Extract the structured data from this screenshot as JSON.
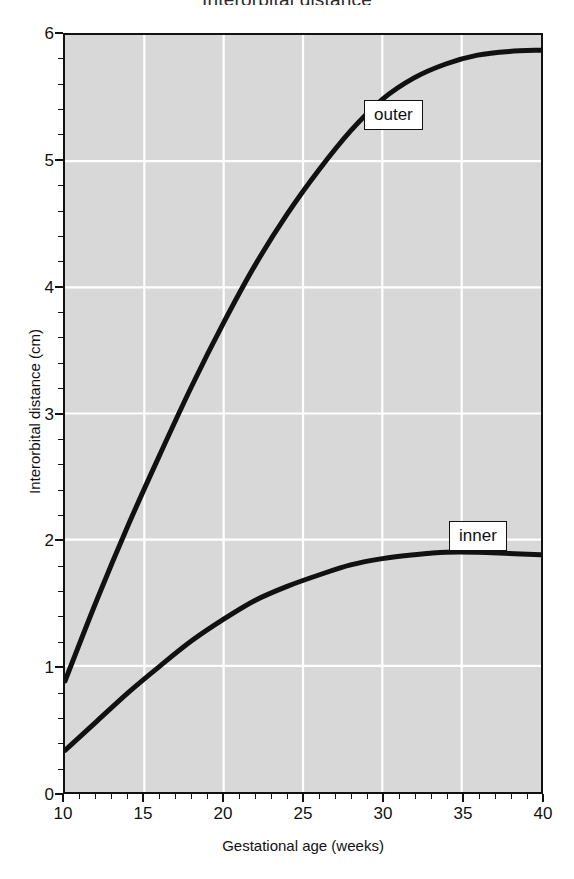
{
  "chart_data": {
    "type": "line",
    "title": "Interorbital distance",
    "xlabel": "Gestational age (weeks)",
    "ylabel": "Interorbital distance (cm)",
    "xlim": [
      10,
      40
    ],
    "ylim": [
      0,
      6
    ],
    "grid": true,
    "grid_color": "#ffffff",
    "plot_background": "#d8d8d8",
    "line_color": "#111111",
    "legend_position": "inline-callout-boxes",
    "x_ticks": [
      10,
      15,
      20,
      25,
      30,
      35,
      40
    ],
    "x_tick_labels": [
      "10",
      "15",
      "20",
      "25",
      "30",
      "35",
      "40"
    ],
    "x_minor_tick_step": 1,
    "y_ticks": [
      0,
      1,
      2,
      3,
      4,
      5,
      6
    ],
    "y_tick_labels": [
      "0",
      "1",
      "2",
      "3",
      "4",
      "5",
      "6"
    ],
    "y_minor_tick_step": 0.2,
    "x": [
      10,
      12,
      14,
      16,
      18,
      20,
      22,
      24,
      26,
      28,
      30,
      32,
      34,
      36,
      38,
      40
    ],
    "series": [
      {
        "name": "outer",
        "label": "outer",
        "values": [
          0.88,
          1.52,
          2.12,
          2.68,
          3.22,
          3.72,
          4.18,
          4.58,
          4.93,
          5.24,
          5.49,
          5.66,
          5.77,
          5.84,
          5.87,
          5.88
        ]
      },
      {
        "name": "inner",
        "label": "inner",
        "values": [
          0.33,
          0.56,
          0.79,
          1.0,
          1.2,
          1.37,
          1.52,
          1.63,
          1.72,
          1.8,
          1.85,
          1.88,
          1.9,
          1.9,
          1.89,
          1.88
        ]
      }
    ],
    "annotations": [
      {
        "text": "outer",
        "x": 29.7,
        "y": 5.38,
        "boxed": true
      },
      {
        "text": "inner",
        "x": 34.9,
        "y": 2.05,
        "boxed": true
      }
    ]
  },
  "axes": {
    "y_title": "Interorbital distance (cm)",
    "x_title": "Gestational age (weeks)",
    "y_labels": [
      "6",
      "5",
      "4",
      "3",
      "2",
      "1",
      "0"
    ],
    "x_labels": [
      "10",
      "15",
      "20",
      "25",
      "30",
      "35",
      "40"
    ]
  },
  "labels": {
    "outer": "outer",
    "inner": "inner"
  },
  "title": "Interorbital distance"
}
